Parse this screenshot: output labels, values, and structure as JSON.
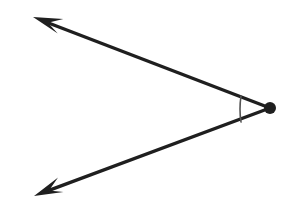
{
  "figure": {
    "background_color": "#ffffff",
    "stroke_color": "#1f1f1f",
    "arc_color": "#555555",
    "width": 288,
    "height": 214
  },
  "chart_data": {
    "type": "diagram",
    "subtype": "geometry-angle",
    "grid": false,
    "legend": false,
    "xlim": [
      0,
      288
    ],
    "ylim": [
      0,
      214
    ],
    "vertex": {
      "name": "vertex-point",
      "x": 270,
      "y": 108,
      "marker": "filled-circle",
      "radius": 6,
      "color": "#1f1f1f"
    },
    "rays": [
      {
        "name": "upper-ray",
        "from": [
          270,
          108
        ],
        "to": [
          33,
          17
        ],
        "arrow": "barbed",
        "arrow_at": "end",
        "stroke_width": 3.4,
        "color": "#1f1f1f",
        "direction_degrees": 159
      },
      {
        "name": "lower-ray",
        "from": [
          270,
          108
        ],
        "to": [
          34,
          196
        ],
        "arrow": "barbed",
        "arrow_at": "end",
        "stroke_width": 3.4,
        "color": "#1f1f1f",
        "direction_degrees": 200
      }
    ],
    "angle_arc": {
      "name": "angle-arc",
      "center": [
        270,
        108
      ],
      "radius": 30,
      "start_point": [
        241,
        96
      ],
      "end_point": [
        241,
        122
      ],
      "bulge_x": 239,
      "stroke_width": 1.6,
      "color": "#555555",
      "measure_degrees": 41
    },
    "labels": []
  }
}
